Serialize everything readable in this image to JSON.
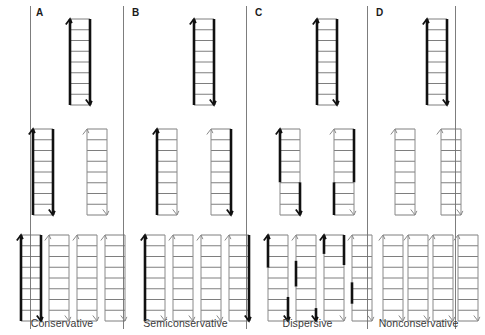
{
  "figure": {
    "background": "#ffffff",
    "width": 469,
    "height": 335,
    "colors": {
      "old_strand": "#111111",
      "new_strand": "#8a8a8a",
      "rung": "#6f6f6f",
      "divider": "#7d7d7d",
      "letter": "#1a1a1a",
      "caption": "#3a3a3a"
    },
    "stroke": {
      "old_width": 2.6,
      "new_width": 1.0,
      "rung_width": 0.9
    },
    "ladder_geometry": {
      "rail_gap": 20,
      "height": 86,
      "rungs": 8
    },
    "rows": [
      {
        "name": "parent",
        "label": "Parental DNA",
        "top": 12
      },
      {
        "name": "generation-1",
        "label": "First generation",
        "top": 122
      },
      {
        "name": "generation-2",
        "label": "Second generation",
        "top": 228
      }
    ]
  },
  "panels": [
    {
      "id": "A",
      "letter": "A",
      "caption": "Conservative",
      "left": 0,
      "width": 124,
      "rows": [
        {
          "row": "parent",
          "ladders": [
            {
              "x": 63,
              "left_strand": [
                [
                  "old",
                  0,
                  1
                ]
              ],
              "right_strand": [
                [
                  "old",
                  0,
                  1
                ]
              ]
            }
          ]
        },
        {
          "row": "generation-1",
          "ladders": [
            {
              "x": 26,
              "left_strand": [
                [
                  "old",
                  0,
                  1
                ]
              ],
              "right_strand": [
                [
                  "old",
                  0,
                  1
                ]
              ]
            },
            {
              "x": 80,
              "left_strand": [
                [
                  "new",
                  0,
                  1
                ]
              ],
              "right_strand": [
                [
                  "new",
                  0,
                  1
                ]
              ]
            }
          ]
        },
        {
          "row": "generation-2",
          "ladders": [
            {
              "x": 14,
              "left_strand": [
                [
                  "old",
                  0,
                  1
                ]
              ],
              "right_strand": [
                [
                  "old",
                  0,
                  1
                ]
              ]
            },
            {
              "x": 42,
              "left_strand": [
                [
                  "new",
                  0,
                  1
                ]
              ],
              "right_strand": [
                [
                  "new",
                  0,
                  1
                ]
              ]
            },
            {
              "x": 70,
              "left_strand": [
                [
                  "new",
                  0,
                  1
                ]
              ],
              "right_strand": [
                [
                  "new",
                  0,
                  1
                ]
              ]
            },
            {
              "x": 98,
              "left_strand": [
                [
                  "new",
                  0,
                  1
                ]
              ],
              "right_strand": [
                [
                  "new",
                  0,
                  1
                ]
              ]
            }
          ]
        }
      ]
    },
    {
      "id": "B",
      "letter": "B",
      "caption": "Semiconservative",
      "left": 124,
      "width": 123,
      "rows": [
        {
          "row": "parent",
          "ladders": [
            {
              "x": 63,
              "left_strand": [
                [
                  "old",
                  0,
                  1
                ]
              ],
              "right_strand": [
                [
                  "old",
                  0,
                  1
                ]
              ]
            }
          ]
        },
        {
          "row": "generation-1",
          "ladders": [
            {
              "x": 26,
              "left_strand": [
                [
                  "old",
                  0,
                  1
                ]
              ],
              "right_strand": [
                [
                  "new",
                  0,
                  1
                ]
              ]
            },
            {
              "x": 80,
              "left_strand": [
                [
                  "new",
                  0,
                  1
                ]
              ],
              "right_strand": [
                [
                  "old",
                  0,
                  1
                ]
              ]
            }
          ]
        },
        {
          "row": "generation-2",
          "ladders": [
            {
              "x": 14,
              "left_strand": [
                [
                  "old",
                  0,
                  1
                ]
              ],
              "right_strand": [
                [
                  "new",
                  0,
                  1
                ]
              ]
            },
            {
              "x": 42,
              "left_strand": [
                [
                  "new",
                  0,
                  1
                ]
              ],
              "right_strand": [
                [
                  "new",
                  0,
                  1
                ]
              ]
            },
            {
              "x": 70,
              "left_strand": [
                [
                  "new",
                  0,
                  1
                ]
              ],
              "right_strand": [
                [
                  "new",
                  0,
                  1
                ]
              ]
            },
            {
              "x": 98,
              "left_strand": [
                [
                  "new",
                  0,
                  1
                ]
              ],
              "right_strand": [
                [
                  "old",
                  0,
                  1
                ]
              ]
            }
          ]
        }
      ]
    },
    {
      "id": "C",
      "letter": "C",
      "caption": "Dispersive",
      "left": 247,
      "width": 121,
      "rows": [
        {
          "row": "parent",
          "ladders": [
            {
              "x": 63,
              "left_strand": [
                [
                  "old",
                  0,
                  1
                ]
              ],
              "right_strand": [
                [
                  "old",
                  0,
                  1
                ]
              ]
            }
          ]
        },
        {
          "row": "generation-1",
          "ladders": [
            {
              "x": 26,
              "left_strand": [
                [
                  "old",
                  0,
                  0.62
                ],
                [
                  "new",
                  0.62,
                  1
                ]
              ],
              "right_strand": [
                [
                  "new",
                  0,
                  0.62
                ],
                [
                  "old",
                  0.62,
                  1
                ]
              ]
            },
            {
              "x": 80,
              "left_strand": [
                [
                  "new",
                  0,
                  0.62
                ],
                [
                  "old",
                  0.62,
                  1
                ]
              ],
              "right_strand": [
                [
                  "old",
                  0,
                  0.62
                ],
                [
                  "new",
                  0.62,
                  1
                ]
              ]
            }
          ]
        },
        {
          "row": "generation-2",
          "ladders": [
            {
              "x": 14,
              "left_strand": [
                [
                  "old",
                  0,
                  0.38
                ],
                [
                  "new",
                  0.38,
                  1
                ]
              ],
              "right_strand": [
                [
                  "new",
                  0,
                  0.72
                ],
                [
                  "old",
                  0.72,
                  1
                ]
              ]
            },
            {
              "x": 42,
              "left_strand": [
                [
                  "new",
                  0,
                  0.3
                ],
                [
                  "old",
                  0.3,
                  0.6
                ],
                [
                  "new",
                  0.6,
                  1
                ]
              ],
              "right_strand": [
                [
                  "new",
                  0,
                  0.85
                ],
                [
                  "old",
                  0.85,
                  1
                ]
              ]
            },
            {
              "x": 70,
              "left_strand": [
                [
                  "old",
                  0,
                  0.22
                ],
                [
                  "new",
                  0.22,
                  1
                ]
              ],
              "right_strand": [
                [
                  "old",
                  0,
                  0.35
                ],
                [
                  "new",
                  0.35,
                  1
                ]
              ]
            },
            {
              "x": 98,
              "left_strand": [
                [
                  "new",
                  0,
                  0.55
                ],
                [
                  "old",
                  0.55,
                  0.8
                ],
                [
                  "new",
                  0.8,
                  1
                ]
              ],
              "right_strand": [
                [
                  "new",
                  0,
                  1
                ]
              ]
            }
          ]
        }
      ]
    },
    {
      "id": "D",
      "letter": "D",
      "caption": "Nonconservative",
      "left": 368,
      "width": 101,
      "rows": [
        {
          "row": "parent",
          "ladders": [
            {
              "x": 52,
              "left_strand": [
                [
                  "old",
                  0,
                  1
                ]
              ],
              "right_strand": [
                [
                  "old",
                  0,
                  1
                ]
              ]
            }
          ]
        },
        {
          "row": "generation-1",
          "ladders": [
            {
              "x": 20,
              "left_strand": [
                [
                  "new",
                  0,
                  1
                ]
              ],
              "right_strand": [
                [
                  "new",
                  0,
                  1
                ]
              ]
            },
            {
              "x": 66,
              "left_strand": [
                [
                  "new",
                  0,
                  1
                ]
              ],
              "right_strand": [
                [
                  "new",
                  0,
                  1
                ]
              ]
            }
          ]
        },
        {
          "row": "generation-2",
          "ladders": [
            {
              "x": 8,
              "left_strand": [
                [
                  "new",
                  0,
                  1
                ]
              ],
              "right_strand": [
                [
                  "new",
                  0,
                  1
                ]
              ]
            },
            {
              "x": 33,
              "left_strand": [
                [
                  "new",
                  0,
                  1
                ]
              ],
              "right_strand": [
                [
                  "new",
                  0,
                  1
                ]
              ]
            },
            {
              "x": 58,
              "left_strand": [
                [
                  "new",
                  0,
                  1
                ]
              ],
              "right_strand": [
                [
                  "new",
                  0,
                  1
                ]
              ]
            },
            {
              "x": 83,
              "left_strand": [
                [
                  "new",
                  0,
                  1
                ]
              ],
              "right_strand": [
                [
                  "new",
                  0,
                  1
                ]
              ]
            }
          ]
        }
      ]
    }
  ],
  "dividers": [
    30,
    123,
    246,
    367,
    455
  ]
}
